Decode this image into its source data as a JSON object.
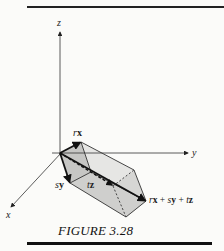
{
  "figure": {
    "caption": "FIGURE 3.28",
    "axes": {
      "x_label": "x",
      "y_label": "y",
      "z_label": "z"
    },
    "vectors": [
      {
        "name": "rx",
        "coef": "r",
        "basis": "x"
      },
      {
        "name": "sy",
        "coef": "s",
        "basis": "y"
      },
      {
        "name": "tz",
        "coef": "t",
        "basis": "z"
      }
    ],
    "sum_label": {
      "r": "r",
      "x": "x",
      "plus1": " + ",
      "s": "s",
      "y": "y",
      "plus2": " + ",
      "t": "t",
      "z": "z"
    },
    "colors": {
      "line": "#222222",
      "face_light": "#e4e4e2",
      "face_mid": "#d2d2d0",
      "face_dark": "#bdbdbb",
      "background": "#fbfbf9"
    }
  }
}
